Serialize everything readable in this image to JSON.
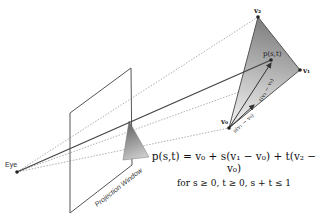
{
  "diagram": {
    "labels": {
      "eye": "Eye",
      "projection_window": "Projection Window",
      "v0": "v₀",
      "v1": "v₁",
      "v2": "v₂",
      "p": "p(s,t)",
      "edge_s": "s(v₁ − v₀)",
      "edge_t": "t(v₂ − v₀)"
    },
    "formula": {
      "main": "p(s,t) = v₀ + s(v₁ − v₀) + t(v₂ − v₀)",
      "condition": "for s ≥ 0, t ≥ 0, s + t ≤ 1"
    },
    "colors": {
      "line": "#555555",
      "dotted": "#999999",
      "triangle_dark": "#808080",
      "triangle_light": "#f2f2f2"
    }
  }
}
